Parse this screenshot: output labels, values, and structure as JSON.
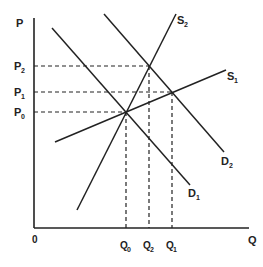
{
  "diagram": {
    "type": "supply-demand",
    "axes": {
      "y_label": "P",
      "x_label": "Q",
      "origin_label": "0"
    },
    "price_levels": [
      {
        "base": "P",
        "sub": "2"
      },
      {
        "base": "P",
        "sub": "1"
      },
      {
        "base": "P",
        "sub": "0"
      }
    ],
    "quantity_levels": [
      {
        "base": "Q",
        "sub": "0"
      },
      {
        "base": "Q",
        "sub": "2"
      },
      {
        "base": "Q",
        "sub": "1"
      }
    ],
    "curves": [
      {
        "base": "S",
        "sub": "2"
      },
      {
        "base": "S",
        "sub": "1"
      },
      {
        "base": "D",
        "sub": "2"
      },
      {
        "base": "D",
        "sub": "1"
      }
    ],
    "equilibria": [
      {
        "curves": "S1-D1",
        "price": "P0",
        "quantity": "Q0"
      },
      {
        "curves": "S2-D2",
        "price": "P2",
        "quantity": "Q2"
      },
      {
        "curves": "S1-D2",
        "price": "P1",
        "quantity": "Q1"
      }
    ],
    "colors": {
      "line": "#222222",
      "background": "#ffffff"
    }
  }
}
